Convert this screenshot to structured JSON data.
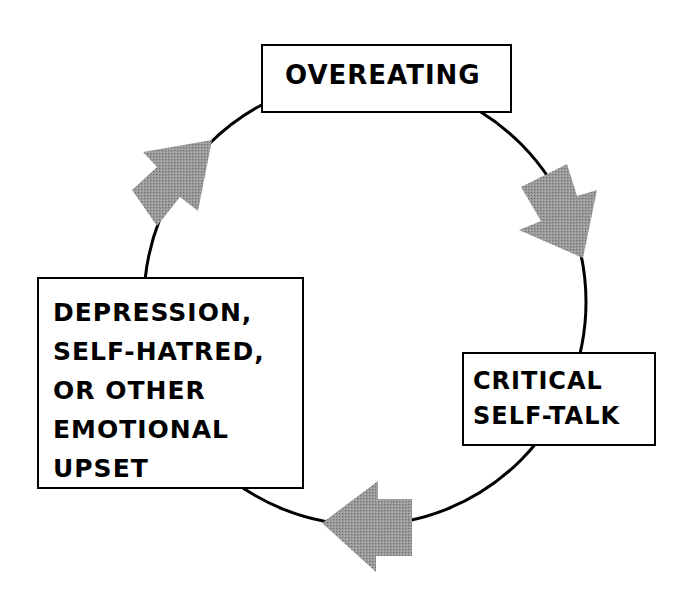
{
  "diagram": {
    "type": "cycle",
    "colors": {
      "line": "#000000",
      "arrow": "#8c8c8c",
      "box_fill": "#ffffff"
    },
    "nodes": [
      {
        "id": "overeating",
        "lines": [
          "OVEREATING"
        ]
      },
      {
        "id": "critical-self-talk",
        "lines": [
          "CRITICAL",
          "SELF-TALK"
        ]
      },
      {
        "id": "emotional-upset",
        "lines": [
          "DEPRESSION,",
          "SELF-HATRED,",
          "OR OTHER",
          "EMOTIONAL",
          "UPSET"
        ]
      }
    ],
    "edges": [
      {
        "from": "overeating",
        "to": "critical-self-talk",
        "arrow": "arrow-down-right-icon"
      },
      {
        "from": "critical-self-talk",
        "to": "emotional-upset",
        "arrow": "arrow-left-icon"
      },
      {
        "from": "emotional-upset",
        "to": "overeating",
        "arrow": "arrow-up-right-icon"
      }
    ]
  }
}
